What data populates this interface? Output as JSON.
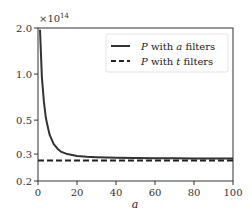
{
  "chart_data": {
    "type": "line",
    "title": "",
    "xlabel": "a",
    "ylabel": "",
    "y_scale": "log",
    "y_multiplier_label": "×10^14",
    "y_multiplier_base": "×10",
    "y_multiplier_exp": "14",
    "xlim": [
      0,
      100
    ],
    "ylim": [
      0.2,
      2.0
    ],
    "x_ticks": [
      0,
      20,
      40,
      60,
      80,
      100
    ],
    "x_tick_labels": [
      "0",
      "20",
      "40",
      "60",
      "80",
      "100"
    ],
    "y_ticks": [
      0.2,
      0.3,
      0.5,
      1.0,
      2.0
    ],
    "y_tick_labels": [
      "0.2",
      "0.3",
      "0.5",
      "1.0",
      "2.0"
    ],
    "grid": false,
    "legend_position": "top-right",
    "series": [
      {
        "name": "P with a filters",
        "legend_prefix": "P",
        "legend_mid": " with ",
        "legend_var": "a",
        "legend_suffix": " filters",
        "style": "solid",
        "color": "#333333",
        "x": [
          1,
          2,
          3,
          4,
          5,
          6,
          8,
          10,
          12,
          15,
          20,
          25,
          30,
          40,
          50,
          60,
          70,
          80,
          90,
          100
        ],
        "y": [
          1.95,
          0.95,
          0.66,
          0.52,
          0.45,
          0.4,
          0.35,
          0.325,
          0.31,
          0.3,
          0.292,
          0.288,
          0.286,
          0.284,
          0.283,
          0.282,
          0.282,
          0.281,
          0.281,
          0.281
        ]
      },
      {
        "name": "P with t filters",
        "legend_prefix": "P",
        "legend_mid": " with ",
        "legend_var": "t",
        "legend_suffix": " filters",
        "style": "dashed",
        "color": "#222222",
        "x": [
          0,
          100
        ],
        "y": [
          0.272,
          0.272
        ]
      }
    ]
  }
}
